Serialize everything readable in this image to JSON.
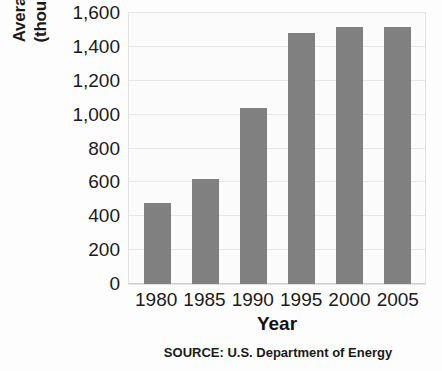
{
  "chart_data": {
    "type": "bar",
    "title": "",
    "subtitle": "",
    "xlabel": "Year",
    "ylabel": "Average Daily Imports (thousands of barrels)",
    "ylabel_line1": "Average Daily Imports",
    "ylabel_line2": "(thousands of barrels)",
    "categories": [
      "1980",
      "1985",
      "1990",
      "1995",
      "2000",
      "2005"
    ],
    "values": [
      480,
      620,
      1040,
      1480,
      1520,
      1515
    ],
    "ylim": [
      0,
      1600
    ],
    "ytick_values": [
      0,
      200,
      400,
      600,
      800,
      1000,
      1200,
      1400,
      1600
    ],
    "ytick_labels": [
      "0",
      "200",
      "400",
      "600",
      "800",
      "1,000",
      "1,200",
      "1,400",
      "1,600"
    ],
    "grid": true,
    "legend": false,
    "legend_position": "none",
    "bar_color": "#808080",
    "gridline_color": "#e6e6e6",
    "plot_background": "#fbfbfb",
    "source_note": "SOURCE: U.S. Department of Energy"
  }
}
